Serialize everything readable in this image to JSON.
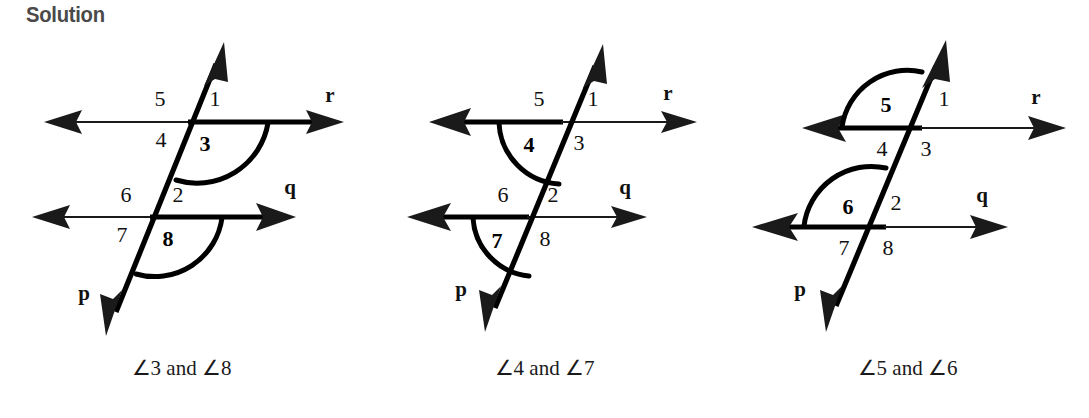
{
  "heading": "Solution",
  "figures": [
    {
      "id": "figure-1",
      "caption": "∠3 and ∠8",
      "line_labels": {
        "top": "r",
        "bottom": "q",
        "transversal": "p"
      },
      "angle_numbers": {
        "top_upper_left": "5",
        "top_upper_right": "1",
        "top_lower_left": "4",
        "top_lower_right": "3",
        "bottom_upper_left": "6",
        "bottom_upper_right": "2",
        "bottom_lower_left": "7",
        "bottom_lower_right": "8"
      },
      "highlighted_angles": [
        "3",
        "8"
      ],
      "highlight_description": "Angle 3 at the upper intersection and angle 8 at the lower intersection are each marked with a bold arc opening to the right, below the horizontal line."
    },
    {
      "id": "figure-2",
      "caption": "∠4 and ∠7",
      "line_labels": {
        "top": "r",
        "bottom": "q",
        "transversal": "p"
      },
      "angle_numbers": {
        "top_upper_left": "5",
        "top_upper_right": "1",
        "top_lower_left": "4",
        "top_lower_right": "3",
        "bottom_upper_left": "6",
        "bottom_upper_right": "2",
        "bottom_lower_left": "7",
        "bottom_lower_right": "8"
      },
      "highlighted_angles": [
        "4",
        "7"
      ],
      "highlight_description": "Angle 4 at the upper intersection and angle 7 at the lower intersection are each marked with a bold arc opening to the left, below the horizontal line."
    },
    {
      "id": "figure-3",
      "caption": "∠5 and ∠6",
      "line_labels": {
        "top": "r",
        "bottom": "q",
        "transversal": "p"
      },
      "angle_numbers": {
        "top_upper_left": "5",
        "top_upper_right": "1",
        "top_lower_left": "4",
        "top_lower_right": "3",
        "bottom_upper_left": "6",
        "bottom_upper_right": "2",
        "bottom_lower_left": "7",
        "bottom_lower_right": "8"
      },
      "highlighted_angles": [
        "5",
        "6"
      ],
      "highlight_description": "Angle 5 at the upper intersection and angle 6 at the lower intersection are each marked with a bold arc opening to the left, above the horizontal line."
    }
  ],
  "colors": {
    "background": "#ffffff",
    "ink": "#1a1a1a",
    "heading": "#4a4a4a"
  }
}
